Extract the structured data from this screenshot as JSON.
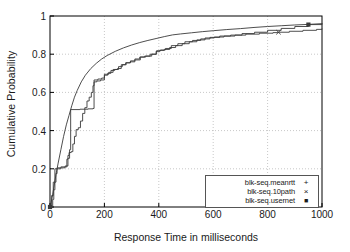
{
  "chart_data": {
    "type": "line",
    "title": "",
    "xlabel": "Response Time in milliseconds",
    "ylabel": "Cumulative Probability",
    "xlim": [
      0,
      1000
    ],
    "ylim": [
      0,
      1
    ],
    "xticks": [
      "0",
      "200",
      "400",
      "600",
      "800",
      "1000"
    ],
    "xtick_values": [
      0,
      200,
      400,
      600,
      800,
      1000
    ],
    "yticks": [
      "0",
      "0.2",
      "0.4",
      "0.6",
      "0.8",
      "1"
    ],
    "ytick_values": [
      0,
      0.2,
      0.4,
      0.6,
      0.8,
      1
    ],
    "grid": true,
    "legend_position": "lower right",
    "series": [
      {
        "name": "blk-seq.meanrtt",
        "marker": "+",
        "style": "smooth",
        "points": [
          [
            0,
            0.0
          ],
          [
            8,
            0.05
          ],
          [
            15,
            0.11
          ],
          [
            22,
            0.17
          ],
          [
            30,
            0.23
          ],
          [
            40,
            0.3
          ],
          [
            50,
            0.37
          ],
          [
            60,
            0.43
          ],
          [
            70,
            0.48
          ],
          [
            80,
            0.53
          ],
          [
            90,
            0.575
          ],
          [
            100,
            0.61
          ],
          [
            115,
            0.655
          ],
          [
            130,
            0.69
          ],
          [
            150,
            0.725
          ],
          [
            170,
            0.752
          ],
          [
            190,
            0.775
          ],
          [
            210,
            0.793
          ],
          [
            240,
            0.815
          ],
          [
            270,
            0.833
          ],
          [
            300,
            0.848
          ],
          [
            330,
            0.861
          ],
          [
            360,
            0.872
          ],
          [
            390,
            0.882
          ],
          [
            420,
            0.892
          ],
          [
            450,
            0.901
          ],
          [
            480,
            0.906
          ],
          [
            520,
            0.912
          ],
          [
            560,
            0.918
          ],
          [
            600,
            0.923
          ],
          [
            650,
            0.929
          ],
          [
            700,
            0.934
          ],
          [
            750,
            0.94
          ],
          [
            800,
            0.945
          ],
          [
            850,
            0.949
          ],
          [
            900,
            0.953
          ],
          [
            950,
            0.956
          ],
          [
            1000,
            0.96
          ]
        ]
      },
      {
        "name": "blk-seq.10path",
        "marker": "×",
        "style": "step",
        "points": [
          [
            0,
            0.0
          ],
          [
            10,
            0.04
          ],
          [
            14,
            0.09
          ],
          [
            18,
            0.13
          ],
          [
            22,
            0.175
          ],
          [
            26,
            0.2
          ],
          [
            40,
            0.205
          ],
          [
            55,
            0.21
          ],
          [
            62,
            0.25
          ],
          [
            66,
            0.27
          ],
          [
            70,
            0.285
          ],
          [
            78,
            0.29
          ],
          [
            84,
            0.33
          ],
          [
            90,
            0.37
          ],
          [
            96,
            0.405
          ],
          [
            104,
            0.415
          ],
          [
            112,
            0.45
          ],
          [
            120,
            0.49
          ],
          [
            128,
            0.52
          ],
          [
            136,
            0.555
          ],
          [
            144,
            0.575
          ],
          [
            152,
            0.6
          ],
          [
            158,
            0.635
          ],
          [
            162,
            0.665
          ],
          [
            176,
            0.67
          ],
          [
            190,
            0.675
          ],
          [
            200,
            0.69
          ],
          [
            212,
            0.7
          ],
          [
            224,
            0.715
          ],
          [
            238,
            0.72
          ],
          [
            252,
            0.735
          ],
          [
            266,
            0.745
          ],
          [
            280,
            0.755
          ],
          [
            296,
            0.765
          ],
          [
            312,
            0.775
          ],
          [
            330,
            0.785
          ],
          [
            348,
            0.79
          ],
          [
            368,
            0.8
          ],
          [
            390,
            0.815
          ],
          [
            404,
            0.82
          ],
          [
            420,
            0.825
          ],
          [
            440,
            0.835
          ],
          [
            462,
            0.845
          ],
          [
            486,
            0.855
          ],
          [
            512,
            0.865
          ],
          [
            540,
            0.875
          ],
          [
            570,
            0.885
          ],
          [
            604,
            0.89
          ],
          [
            640,
            0.895
          ],
          [
            680,
            0.9
          ],
          [
            720,
            0.905
          ],
          [
            770,
            0.91
          ],
          [
            820,
            0.913
          ],
          [
            840,
            0.915
          ],
          [
            880,
            0.92
          ],
          [
            930,
            0.925
          ],
          [
            980,
            0.93
          ],
          [
            1000,
            0.932
          ]
        ],
        "marker_points": [
          [
            840,
            0.915
          ]
        ]
      },
      {
        "name": "blk-seq.usernet",
        "marker": "■",
        "style": "step",
        "points": [
          [
            0,
            0.0
          ],
          [
            6,
            0.06
          ],
          [
            12,
            0.13
          ],
          [
            18,
            0.2
          ],
          [
            26,
            0.205
          ],
          [
            40,
            0.21
          ],
          [
            56,
            0.215
          ],
          [
            66,
            0.255
          ],
          [
            72,
            0.3
          ],
          [
            76,
            0.51
          ],
          [
            110,
            0.512
          ],
          [
            140,
            0.514
          ],
          [
            158,
            0.516
          ],
          [
            162,
            0.655
          ],
          [
            172,
            0.66
          ],
          [
            186,
            0.665
          ],
          [
            200,
            0.695
          ],
          [
            216,
            0.705
          ],
          [
            232,
            0.72
          ],
          [
            248,
            0.725
          ],
          [
            262,
            0.745
          ],
          [
            278,
            0.755
          ],
          [
            294,
            0.76
          ],
          [
            312,
            0.77
          ],
          [
            332,
            0.785
          ],
          [
            352,
            0.79
          ],
          [
            374,
            0.8
          ],
          [
            392,
            0.818
          ],
          [
            406,
            0.822
          ],
          [
            424,
            0.83
          ],
          [
            446,
            0.845
          ],
          [
            470,
            0.855
          ],
          [
            496,
            0.865
          ],
          [
            524,
            0.872
          ],
          [
            554,
            0.88
          ],
          [
            588,
            0.888
          ],
          [
            624,
            0.895
          ],
          [
            664,
            0.9
          ],
          [
            706,
            0.908
          ],
          [
            752,
            0.915
          ],
          [
            800,
            0.925
          ],
          [
            850,
            0.935
          ],
          [
            900,
            0.945
          ],
          [
            950,
            0.955
          ],
          [
            1000,
            0.958
          ]
        ],
        "marker_points": [
          [
            950,
            0.955
          ],
          [
            0,
            0.0
          ]
        ]
      }
    ],
    "annotations": [
      {
        "type": "vertical-drop",
        "x": 76,
        "y0": 0,
        "y1": 0.51,
        "note": "sharp vertical rise of blk-seq.usernet near 76 ms"
      }
    ]
  },
  "legend": {
    "items": [
      {
        "label": "blk-seq.meanrtt",
        "marker": "+"
      },
      {
        "label": "blk-seq.10path",
        "marker": "×"
      },
      {
        "label": "blk-seq.usernet",
        "marker": "■"
      }
    ]
  },
  "colors": {
    "line": "#3a3a3a",
    "axis": "#000000",
    "grid": "#b0b0b0",
    "background": "#ffffff",
    "text": "#1a1a1a"
  }
}
